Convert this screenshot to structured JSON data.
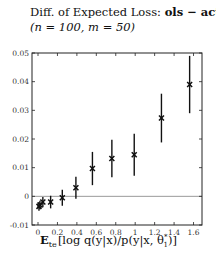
{
  "chart_data": {
    "type": "scatter",
    "title": "Diff. of Expected Loss: ols − act",
    "title_prefix": "Diff. of Expected Loss: ",
    "title_bold": "ols − act",
    "subtitle": "(n = 100, m = 50)",
    "xlabel": "E_te [log q(y|x)/p(y|x, θ*_1)]",
    "xlabel_parts": {
      "E": "E",
      "sub": "te",
      "rest": "[log q(y|x)/p(y|x, θ",
      "sup": "*",
      "sub2": "1",
      "close": ")]"
    },
    "ylabel": "",
    "xlim": [
      -0.05,
      1.7
    ],
    "ylim": [
      -0.01,
      0.05
    ],
    "xticks": [
      0,
      0.2,
      0.4,
      0.6,
      0.8,
      1,
      1.2,
      1.4,
      1.6
    ],
    "xtick_labels": [
      "0",
      "0.2",
      "0.4",
      "0.6",
      "0.8",
      "1",
      "1.2",
      "1.4",
      "1.6"
    ],
    "yticks": [
      -0.01,
      0,
      0.01,
      0.02,
      0.03,
      0.04,
      0.05
    ],
    "ytick_labels": [
      "-0.01",
      "0",
      "0.01",
      "0.02",
      "0.03",
      "0.04",
      "0.05"
    ],
    "grid": false,
    "reference_line": {
      "y": 0,
      "color": "#999999"
    },
    "marker": "x",
    "series": [
      {
        "name": "ols - act",
        "x": [
          0.01,
          0.02,
          0.05,
          0.13,
          0.25,
          0.39,
          0.56,
          0.76,
          0.99,
          1.27,
          1.56
        ],
        "y": [
          -0.0035,
          -0.003,
          -0.002,
          -0.002,
          -0.0005,
          0.003,
          0.0097,
          0.0132,
          0.0145,
          0.0273,
          0.039
        ],
        "err": [
          0.0015,
          0.0015,
          0.0018,
          0.0022,
          0.0028,
          0.0038,
          0.0058,
          0.0065,
          0.0073,
          0.0085,
          0.01
        ]
      }
    ]
  }
}
